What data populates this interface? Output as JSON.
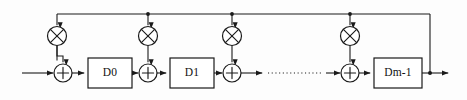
{
  "figure": {
    "name": "transposed-direct-form-fir-filter",
    "kind": "block-diagram",
    "background_color": "#fdfdfd",
    "line_color": "#1a1a1a",
    "width": 467,
    "height": 100
  },
  "signal_path": {
    "main_line_y": 73,
    "feedback_line_y": 14,
    "input_start_x": 22,
    "output_end_x": 452
  },
  "delay_blocks": [
    {
      "id": "d0",
      "label": "D0",
      "x": 88,
      "y": 58,
      "width": 44,
      "height": 30
    },
    {
      "id": "d1",
      "label": "D1",
      "x": 170,
      "y": 58,
      "width": 44,
      "height": 30
    },
    {
      "id": "dm1",
      "label": "Dm-1",
      "x": 374,
      "y": 58,
      "width": 48,
      "height": 30
    }
  ],
  "multipliers": [
    {
      "id": "mul0",
      "glyph": "multiply-circle",
      "cx": 57,
      "cy": 36,
      "r": 9.5
    },
    {
      "id": "mul1",
      "glyph": "multiply-circle",
      "cx": 148,
      "cy": 36,
      "r": 9.5
    },
    {
      "id": "mul2",
      "glyph": "multiply-circle",
      "cx": 232,
      "cy": 36,
      "r": 9.5
    },
    {
      "id": "mul3",
      "glyph": "multiply-circle",
      "cx": 350,
      "cy": 36,
      "r": 9.5
    }
  ],
  "adders": [
    {
      "id": "add0",
      "glyph": "plus-circle",
      "cx": 63,
      "cy": 73,
      "r": 9
    },
    {
      "id": "add1",
      "glyph": "plus-circle",
      "cx": 148,
      "cy": 73,
      "r": 9
    },
    {
      "id": "add2",
      "glyph": "plus-circle",
      "cx": 232,
      "cy": 73,
      "r": 9
    },
    {
      "id": "add3",
      "glyph": "plus-circle",
      "cx": 350,
      "cy": 73,
      "r": 9
    }
  ],
  "ellipsis": {
    "id": "continuation-dots",
    "label": "............",
    "x1": 268,
    "x2": 322,
    "y": 73
  },
  "tap_points": [
    {
      "id": "tap-mul1",
      "cx": 148,
      "cy": 14
    },
    {
      "id": "tap-mul2",
      "cx": 232,
      "cy": 14
    },
    {
      "id": "tap-mul3",
      "cx": 350,
      "cy": 14
    },
    {
      "id": "tap-output",
      "cx": 430,
      "cy": 73
    }
  ],
  "annotations": {
    "description": "Transposed FIR filter structure with delay elements D0, D1, ... Dm-1, coefficient multipliers and summing junctions, with a common feedback/broadcast line along the top."
  }
}
